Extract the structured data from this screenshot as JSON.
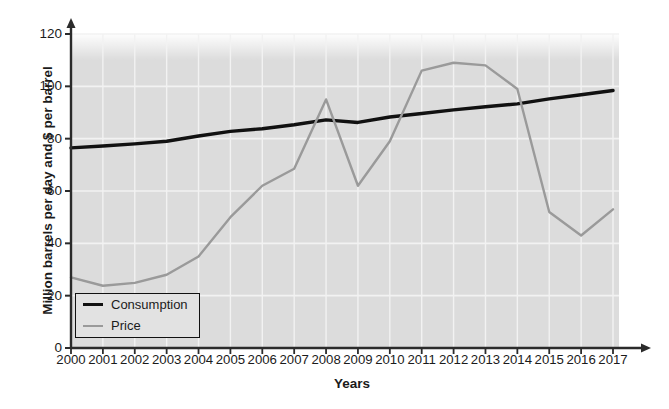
{
  "chart_data": {
    "type": "line",
    "title": "",
    "xlabel": "Years",
    "ylabel": "Million barrels per day and $ per barrel",
    "categories": [
      "2000",
      "2001",
      "2002",
      "2003",
      "2004",
      "2005",
      "2006",
      "2007",
      "2008",
      "2009",
      "2010",
      "2011",
      "2012",
      "2013",
      "2014",
      "2015",
      "2016",
      "2017"
    ],
    "x": [
      2000,
      2001,
      2002,
      2003,
      2004,
      2005,
      2006,
      2007,
      2008,
      2009,
      2010,
      2011,
      2012,
      2013,
      2014,
      2015,
      2016,
      2017
    ],
    "xlim": [
      2000,
      2017
    ],
    "ylim": [
      0,
      120
    ],
    "ytick_values": [
      0,
      20,
      40,
      60,
      80,
      100,
      120
    ],
    "ytick_labels": [
      "0",
      "20",
      "40",
      "60",
      "80",
      "100",
      "120"
    ],
    "grid": true,
    "legend_position": "lower left",
    "plot_background": "#dcdcdc",
    "grid_color": "#f2f2f2",
    "series": [
      {
        "name": "Consumption",
        "color": "#111111",
        "values": [
          76.5,
          77.2,
          78.0,
          79.0,
          81.0,
          82.8,
          83.8,
          85.3,
          87.2,
          86.2,
          88.3,
          89.6,
          91.0,
          92.2,
          93.3,
          95.2,
          96.8,
          98.4
        ]
      },
      {
        "name": "Price",
        "color": "#9a9a9a",
        "values": [
          27.0,
          23.8,
          24.9,
          28.0,
          35.0,
          50.0,
          62.0,
          68.5,
          95.0,
          62.0,
          79.0,
          106.0,
          109.0,
          108.0,
          99.0,
          52.0,
          43.0,
          53.0
        ]
      }
    ]
  },
  "legend": {
    "entries": [
      {
        "label": "Consumption",
        "swatch": "consumption"
      },
      {
        "label": "Price",
        "swatch": "price"
      }
    ]
  },
  "axes": {
    "y_title": "Million barrels per day and $ per barrel",
    "x_title": "Years"
  }
}
